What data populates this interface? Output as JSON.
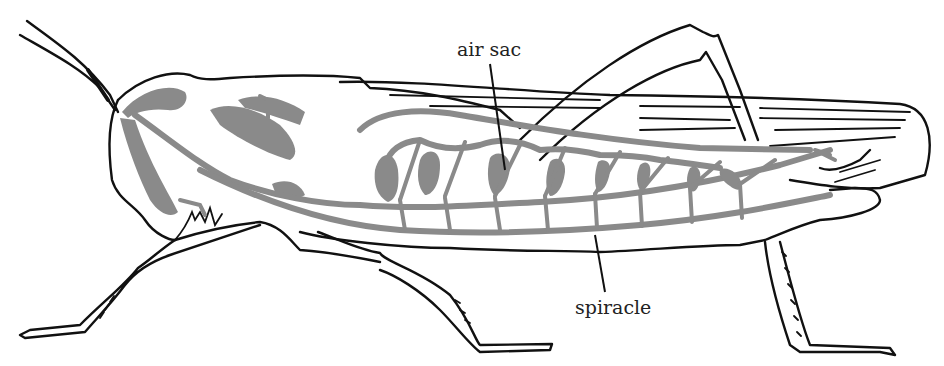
{
  "diagram": {
    "colors": {
      "outline": "#111111",
      "tracheal_system": "#8a8a8a",
      "background": "#ffffff"
    },
    "labels": {
      "air_sac": "air sac",
      "spiracle": "spiracle"
    }
  }
}
